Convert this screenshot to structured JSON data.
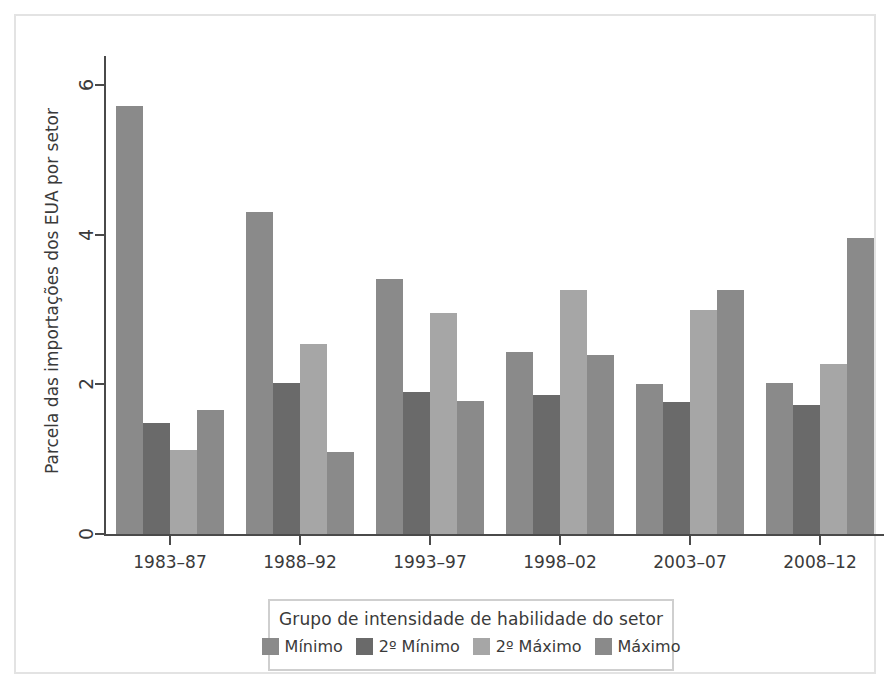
{
  "chart_data": {
    "type": "bar",
    "title": "",
    "xlabel": "",
    "ylabel": "Parcela das importações dos EUA por setor",
    "categories": [
      "1983–87",
      "1988–92",
      "1993–97",
      "1998–02",
      "2003–07",
      "2008–12"
    ],
    "ylim": [
      0,
      6.3
    ],
    "yticks": [
      0,
      2,
      4,
      6
    ],
    "ytick_labels": [
      "0",
      "2",
      "4",
      "6"
    ],
    "grid": false,
    "legend_position": "bottom",
    "legend_title": "Grupo de intensidade de habilidade do setor",
    "series": [
      {
        "name": "Mínimo",
        "color": "#8a8a8a",
        "values": [
          5.73,
          4.31,
          3.41,
          2.44,
          2.01,
          2.02
        ]
      },
      {
        "name": "2º Mínimo",
        "color": "#6a6a6a",
        "values": [
          1.49,
          2.02,
          1.9,
          1.86,
          1.76,
          1.73
        ]
      },
      {
        "name": "2º Máximo",
        "color": "#a6a6a6",
        "values": [
          1.12,
          2.54,
          2.95,
          3.27,
          2.99,
          2.28
        ]
      },
      {
        "name": "Máximo",
        "color": "#8a8a8a",
        "values": [
          1.66,
          1.1,
          1.78,
          2.4,
          3.27,
          3.96
        ]
      }
    ]
  },
  "frame": {
    "border_color": "#e3e3e3",
    "background": "#ffffff"
  },
  "axis": {
    "color": "#4a4a4a"
  }
}
